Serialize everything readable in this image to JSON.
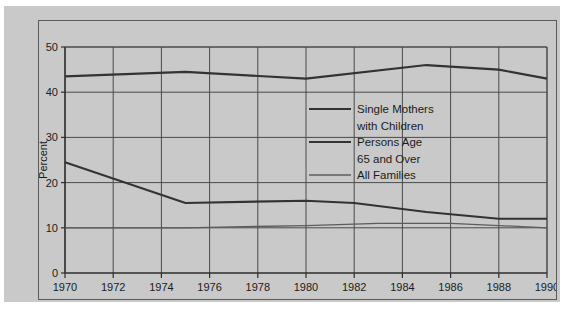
{
  "chart_data": {
    "type": "line",
    "title": "",
    "xlabel": "Year",
    "ylabel": "Percent",
    "xlim": [
      1970,
      1990
    ],
    "ylim": [
      0,
      50
    ],
    "xticks": [
      1970,
      1972,
      1974,
      1976,
      1978,
      1980,
      1982,
      1984,
      1986,
      1988,
      1990
    ],
    "yticks": [
      0,
      10,
      20,
      30,
      40,
      50
    ],
    "xtick_labels": [
      "1970",
      "1972",
      "1974",
      "1976",
      "1978",
      "1980",
      "1982",
      "1984",
      "1986",
      "1988",
      "1990"
    ],
    "ytick_labels": [
      "0",
      "10",
      "20",
      "30",
      "40",
      "50"
    ],
    "grid": true,
    "legend_position": "center",
    "series": [
      {
        "name": "Single Mothers with Children",
        "style": "thick",
        "x": [
          1970,
          1975,
          1980,
          1985,
          1988,
          1990
        ],
        "values": [
          43.5,
          44.5,
          43.0,
          46.0,
          45.0,
          43.0
        ]
      },
      {
        "name": "Persons Age 65 and Over",
        "style": "thick",
        "x": [
          1970,
          1975,
          1980,
          1982,
          1985,
          1988,
          1990
        ],
        "values": [
          24.5,
          15.5,
          16.0,
          15.5,
          13.5,
          12.0,
          12.0
        ]
      },
      {
        "name": "All Families",
        "style": "thin",
        "x": [
          1970,
          1975,
          1980,
          1983,
          1986,
          1988,
          1990
        ],
        "values": [
          10.0,
          10.0,
          10.5,
          11.0,
          11.0,
          10.5,
          10.0
        ]
      }
    ]
  },
  "legend": {
    "lines": [
      {
        "text": "Single Mothers",
        "swatch": "thick"
      },
      {
        "text": "with Children",
        "swatch": "none"
      },
      {
        "text": "Persons Age",
        "swatch": "thick"
      },
      {
        "text": "65 and Over",
        "swatch": "none"
      },
      {
        "text": "All Families",
        "swatch": "thin"
      }
    ]
  },
  "colors": {
    "panel_background": "#c9c9c9",
    "page_background": "#ffffff",
    "grid": "#4a4a4a",
    "axis": "#2e2e2e",
    "series_thick": "#333333",
    "series_thin": "#5c5c5c",
    "text": "#1b1b1b"
  }
}
